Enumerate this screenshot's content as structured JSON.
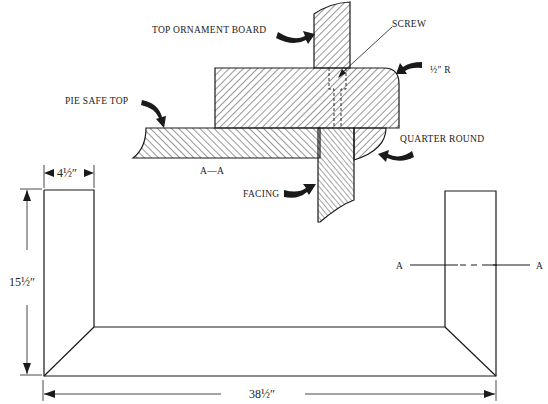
{
  "diagram": {
    "section_view": {
      "labels": {
        "top_ornament_board": "TOP ORNAMENT BOARD",
        "screw": "SCREW",
        "radius": "½″ R",
        "pie_safe_top": "PIE SAFE TOP",
        "quarter_round": "QUARTER ROUND",
        "facing": "FACING",
        "section_id": "A—A"
      }
    },
    "plan_view": {
      "dimensions": {
        "width": "4½″",
        "height": "15½″",
        "length": "38½″"
      },
      "section_marks": {
        "left": "A",
        "right": "A"
      }
    },
    "colors": {
      "ink": "#1a1a1a",
      "background": "#ffffff"
    }
  }
}
